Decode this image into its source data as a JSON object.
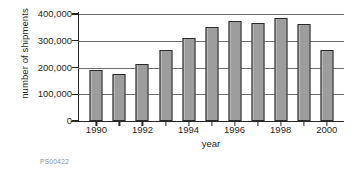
{
  "chart_data": {
    "type": "bar",
    "title": "",
    "subtitle": "",
    "xlabel": "year",
    "ylabel": "number of shipments",
    "categories": [
      1990,
      1991,
      1992,
      1993,
      1994,
      1995,
      1996,
      1997,
      1998,
      1999,
      2000
    ],
    "values": [
      190000,
      175000,
      212000,
      265000,
      310000,
      350000,
      374000,
      368000,
      384000,
      363000,
      264000
    ],
    "ylim": [
      0,
      400000
    ],
    "xlim": [
      1989.5,
      2000.5
    ],
    "yticks": [
      0,
      100000,
      200000,
      300000,
      400000
    ],
    "ytick_labels": [
      "0",
      "100,000",
      "200,000",
      "300,000",
      "400,000"
    ],
    "xticks": [
      1990,
      1992,
      1994,
      1996,
      1998,
      2000
    ],
    "xtick_labels": [
      "1990",
      "1992",
      "1994",
      "1996",
      "1998",
      "2000"
    ],
    "grid": true,
    "grid_axis": "y",
    "legend": null,
    "legend_position": "none",
    "bar_fill_color": "#9d9d9d",
    "bar_edge_color": "#2b2b2b",
    "axis_color": "#262626",
    "gridline_color": "#6f6f6f",
    "background_color": "#ffffff"
  },
  "footer": {
    "code": "PS00422"
  }
}
